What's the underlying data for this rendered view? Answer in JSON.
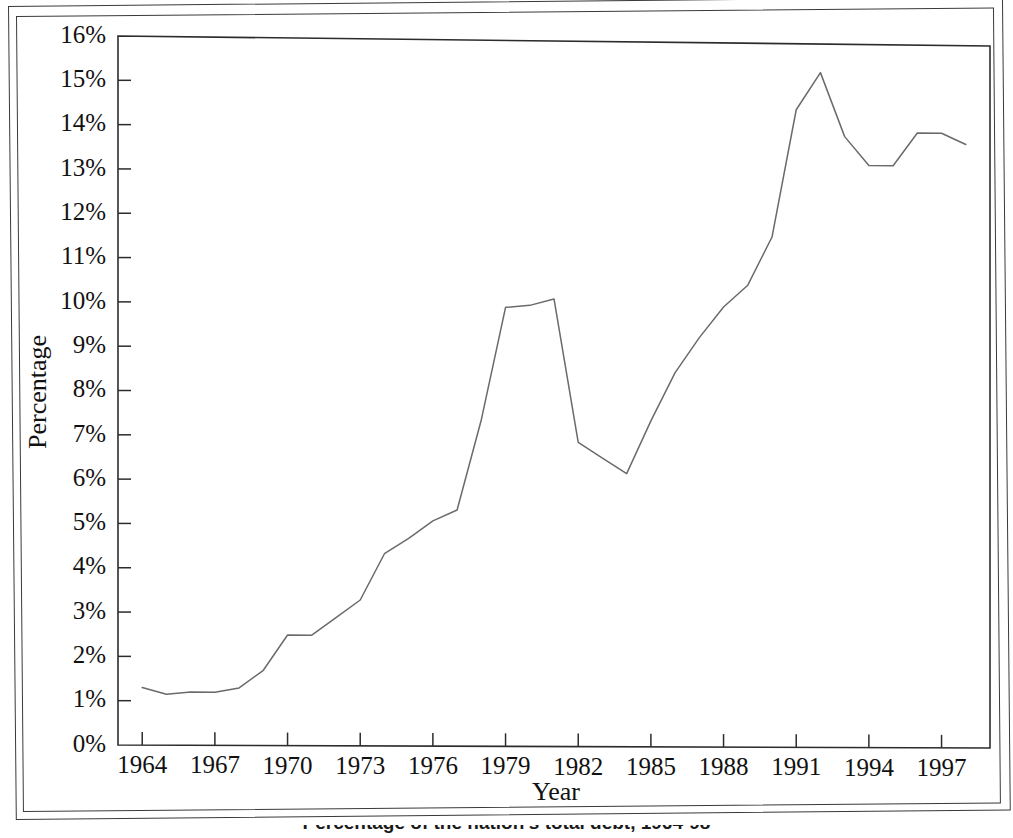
{
  "figure": {
    "caption": "Percentage of the nation's total debt, 1964-98",
    "caption_visible_fragment": "1964-98"
  },
  "chart_data": {
    "type": "line",
    "title": "",
    "xlabel": "Year",
    "ylabel": "Percentage",
    "xlim": [
      1963,
      1999
    ],
    "ylim": [
      0,
      16
    ],
    "y_tick_labels": [
      "0%",
      "1%",
      "2%",
      "3%",
      "4%",
      "5%",
      "6%",
      "7%",
      "8%",
      "9%",
      "10%",
      "11%",
      "12%",
      "13%",
      "14%",
      "15%",
      "16%"
    ],
    "y_tick_values": [
      0,
      1,
      2,
      3,
      4,
      5,
      6,
      7,
      8,
      9,
      10,
      11,
      12,
      13,
      14,
      15,
      16
    ],
    "y_unit": "%",
    "x_tick_labels": [
      "1964",
      "1967",
      "1970",
      "1973",
      "1976",
      "1979",
      "1982",
      "1985",
      "1988",
      "1991",
      "1994",
      "1997"
    ],
    "x_tick_values": [
      1964,
      1967,
      1970,
      1973,
      1976,
      1979,
      1982,
      1985,
      1988,
      1991,
      1994,
      1997
    ],
    "x_tick_step": 3,
    "grid": false,
    "legend": null,
    "legend_position": "none",
    "line_color": "#6a6a6a",
    "x": [
      1964,
      1965,
      1966,
      1967,
      1968,
      1969,
      1970,
      1971,
      1972,
      1973,
      1974,
      1975,
      1976,
      1977,
      1978,
      1979,
      1980,
      1981,
      1982,
      1983,
      1984,
      1985,
      1986,
      1987,
      1988,
      1989,
      1990,
      1991,
      1992,
      1993,
      1994,
      1995,
      1996,
      1997,
      1998
    ],
    "values": [
      1.3,
      1.15,
      1.2,
      1.2,
      1.3,
      1.7,
      2.5,
      2.5,
      2.9,
      3.3,
      4.35,
      4.7,
      5.1,
      5.35,
      7.4,
      9.95,
      10.0,
      10.15,
      6.9,
      6.55,
      6.2,
      7.4,
      8.5,
      9.3,
      10.0,
      10.5,
      11.6,
      14.5,
      15.35,
      13.9,
      13.25,
      13.25,
      14.0,
      14.0,
      13.75
    ],
    "series": [
      {
        "name": "Percentage of total debt",
        "values": [
          1.3,
          1.15,
          1.2,
          1.2,
          1.3,
          1.7,
          2.5,
          2.5,
          2.9,
          3.3,
          4.35,
          4.7,
          5.1,
          5.35,
          7.4,
          9.95,
          10.0,
          10.15,
          6.9,
          6.55,
          6.2,
          7.4,
          8.5,
          9.3,
          10.0,
          10.5,
          11.6,
          14.5,
          15.35,
          13.9,
          13.25,
          13.25,
          14.0,
          14.0,
          13.75
        ]
      }
    ],
    "annotations": {
      "local_peak_1981": 10.15,
      "trough_1984": 6.2,
      "global_peak_1992": 15.35,
      "final_1998": 13.75
    }
  }
}
